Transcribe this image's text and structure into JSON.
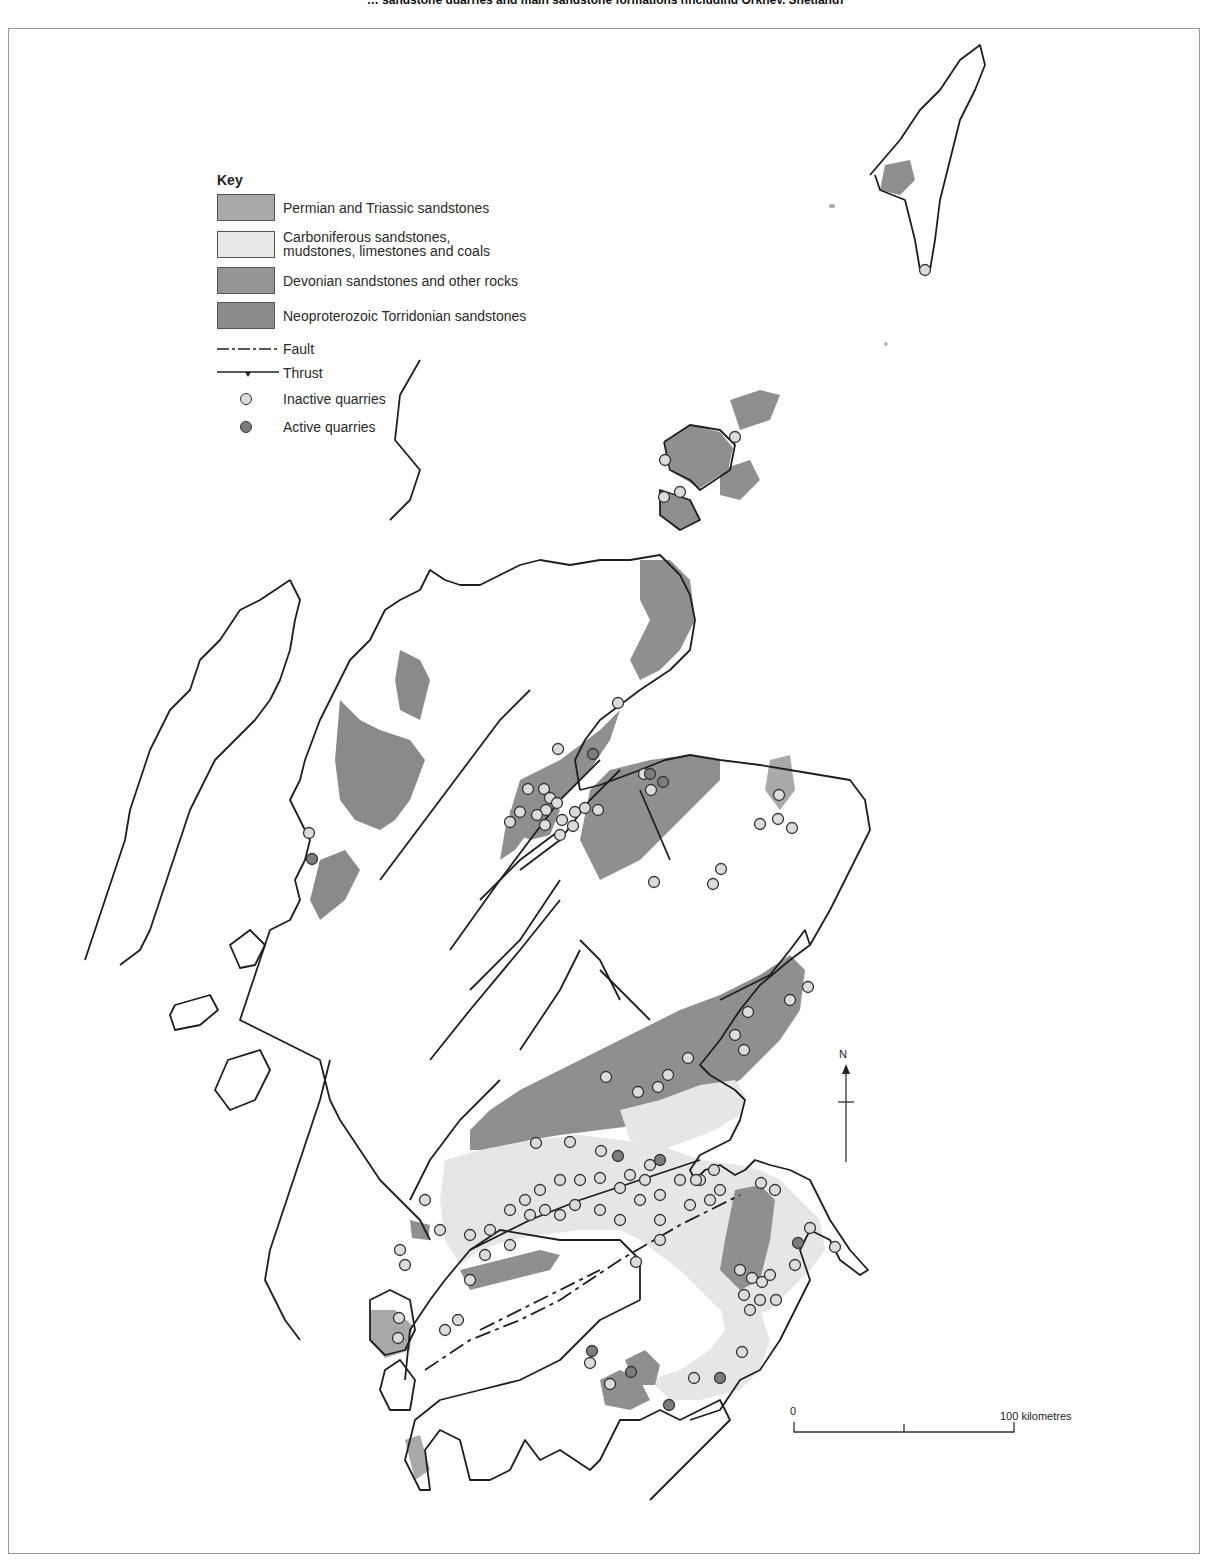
{
  "figure": {
    "caption_partial": "… sandstone quarries and main sandstone formations (including Orkney, Shetland)"
  },
  "colors": {
    "permian_triassic": "#a9a9a9",
    "carboniferous": "#e6e6e6",
    "devonian": "#8f8f8f",
    "torridonian": "#8a8a8a",
    "coastline": "#1e1e1e",
    "inactive_quarry": "#dcdcdc",
    "active_quarry": "#7c7c7c",
    "frame": "#9a9a9a"
  },
  "legend": {
    "title": "Key",
    "units": [
      {
        "label": "Permian and Triassic sandstones",
        "color": "#a9a9a9"
      },
      {
        "label": "Carboniferous sandstones,\nmudstones, limestones and coals",
        "color": "#e8e8e8"
      },
      {
        "label": "Devonian sandstones and other rocks",
        "color": "#959595"
      },
      {
        "label": "Neoproterozoic Torridonian sandstones",
        "color": "#8a8a8a"
      }
    ],
    "lines": [
      {
        "label": "Fault",
        "style": "dash-dot"
      },
      {
        "label": "Thrust",
        "style": "barbed"
      }
    ],
    "points": [
      {
        "label": "Inactive quarries",
        "color": "#dcdcdc"
      },
      {
        "label": "Active quarries",
        "color": "#7c7c7c"
      }
    ]
  },
  "north_arrow": {
    "label": "N"
  },
  "scale_bar": {
    "start_label": "0",
    "end_label": "100 kilometres"
  },
  "map": {
    "coastlines": [
      "M640,1300 L600,1320 L560,1360 L520,1380 L480,1390 L440,1400 L415,1420 L405,1460 L420,1490 L430,1490 L425,1450 L440,1430 L460,1440 L470,1480 L490,1480 L510,1470 L525,1440 L540,1460 L560,1450 L590,1470 L600,1460 L620,1420 L640,1420 L660,1410 L680,1420 L700,1410 L720,1400 L730,1420 L700,1450 L660,1490 L650,1500",
      "M640,1300 L640,1260 L620,1240 L560,1240 L500,1230 L470,1250 L445,1280 L430,1300 L410,1330 L405,1380",
      "M690,1420 L720,1410 L740,1380 L760,1370 L780,1340 L790,1320 L800,1300 L810,1280 L800,1250 L810,1230 L830,1240 L840,1260 L860,1275 L868,1270 L850,1250 L830,1220 L820,1200 L810,1180 L790,1170 L770,1165 L755,1160 L745,1170 L735,1175 L720,1165 L705,1170 L695,1180",
      "M695,1180 L690,1170 L700,1155 L730,1140 L740,1120 L745,1100 L735,1090 L710,1075 L700,1065 L720,1040 L740,1010 L760,985 L790,960 L810,945 L805,930 L790,950 L770,975 L740,990 L720,1000",
      "M810,945 L830,910 L845,880 L860,850 L870,830 L865,800 L850,780 L820,775 L790,770 L760,765 L720,760 L690,755 L665,760 L640,770 L600,785 L580,790",
      "M580,790 L575,760 L585,740 L600,720 L640,690 L670,670 L690,650 L695,620 L690,595 L680,575 L660,555 L630,560 L600,560 L570,565 L540,560 L520,565 L500,575 L480,585 L460,585 L445,580",
      "M445,580 L430,570 L420,590 L400,600 L385,610 L370,640 L350,660 L340,680 L330,700 L320,720 L305,760 L300,780 L290,800 L300,820 L310,840 L305,860 L295,880 L300,900 L290,920 L270,930 L260,960 L250,990 L240,1020 L260,1030 L280,1040 L300,1050 L320,1060 L330,1100 L340,1120 L360,1150 L380,1180 L400,1200 L420,1220 L430,1240",
      "M330,1060 L320,1100 L310,1130 L300,1160 L290,1190 L280,1220 L270,1250 L265,1280 L275,1300 L285,1320 L300,1340",
      "M290,580 L260,600 L240,610 L220,640 L200,660 L190,690 L170,710 L160,730 L150,750 L140,780 L130,810 L125,840 L115,870 L105,900 L95,930 L85,960",
      "M290,580 L300,600 L295,620 L290,650 L280,680 L270,700 L255,720 L235,740 L215,760 L200,790 L190,810 L180,840 L170,870 L160,900 L150,930 L140,950 L120,965",
      "M420,360 L400,395 L395,440 L420,470 L410,500 L390,520",
      "M870,175 L900,140 L920,110 L940,90 L960,60 L980,45 L985,65 L975,90 L960,120 L950,160 L940,200 L935,240 L930,270 L920,270 L915,240 L905,200 L880,190 L875,175",
      "M664,442 L690,425 L720,430 L735,445 L730,470 L700,490 L690,480 L670,470 L664,442",
      "M660,490 L690,500 L700,520 L680,530 L660,515 Z",
      "M370,1300 L390,1290 L410,1300 L415,1330 L405,1350 L385,1355 L370,1340 Z",
      "M385,1370 L400,1360 L415,1380 L410,1410 L390,1410 L380,1390 Z",
      "M228,1060 L260,1050 L270,1070 L255,1100 L230,1110 L215,1090 Z",
      "M230,945 L250,930 L265,945 L255,965 L240,968 Z",
      "M175,1005 L210,995 L218,1010 L200,1025 L175,1030 L170,1015 Z"
    ],
    "units": [
      {
        "unit": "devonian",
        "path": "M590,790 L610,770 L650,760 L690,755 L720,760 L720,780 L700,800 L680,820 L660,840 L640,860 L620,870 L600,880 L590,860 L580,840 Z"
      },
      {
        "unit": "devonian",
        "path": "M640,560 L670,560 L690,580 L695,620 L680,650 L660,670 L640,680 L630,660 L640,640 L650,620 L640,600 Z"
      },
      {
        "unit": "devonian",
        "path": "M520,780 L560,760 L600,730 L620,710 L610,740 L590,770 L570,790 L550,810 L530,830 L515,850 L500,860 L505,830 Z"
      },
      {
        "unit": "devonian",
        "path": "M510,810 L540,800 L560,810 L550,835 L530,840 L510,830 Z"
      },
      {
        "unit": "torridonian",
        "path": "M340,700 L360,720 L380,730 L410,740 L425,760 L410,800 L395,820 L380,830 L355,820 L340,800 L335,760 Z"
      },
      {
        "unit": "torridonian",
        "path": "M400,650 L420,660 L430,680 L420,720 L400,710 L395,680 Z"
      },
      {
        "unit": "torridonian",
        "path": "M320,860 L345,850 L360,870 L345,900 L320,920 L310,900 Z"
      },
      {
        "unit": "devonian",
        "path": "M665,1115 L700,1100 L740,1080 L760,1060 L780,1040 L800,1010 L805,970 L790,955 L760,975 L720,995 L680,1010 L640,1030 L600,1050 L560,1070 L520,1090 L490,1110 L470,1130 L470,1150 L500,1150 L530,1140 L560,1135 L600,1130 L640,1125 Z"
      },
      {
        "unit": "carboniferous",
        "path": "M445,1160 L480,1150 L530,1140 L580,1135 L620,1140 L660,1145 L700,1160 L740,1165 L760,1170 L780,1180 L800,1200 L820,1220 L825,1250 L810,1270 L790,1290 L770,1310 L740,1320 L720,1310 L700,1290 L680,1270 L660,1255 L640,1240 L620,1230 L580,1230 L540,1235 L510,1240 L480,1250 L460,1265 L445,1240 L440,1200 Z"
      },
      {
        "unit": "carboniferous",
        "path": "M620,1110 L660,1100 L700,1085 L735,1080 L745,1095 L740,1115 L715,1130 L690,1140 L660,1150 L630,1140 Z"
      },
      {
        "unit": "devonian",
        "path": "M735,1190 L760,1185 L775,1200 L770,1240 L760,1280 L740,1290 L720,1270 L725,1240 Z"
      },
      {
        "unit": "devonian",
        "path": "M460,1270 L500,1260 L540,1250 L560,1255 L550,1270 L510,1280 L470,1290 Z"
      },
      {
        "unit": "carboniferous",
        "path": "M720,1300 L760,1310 L770,1340 L760,1370 L740,1390 L700,1400 L670,1400 L650,1380 L680,1370 L710,1350 L725,1330 Z"
      },
      {
        "unit": "devonian",
        "path": "M600,1380 L620,1370 L640,1380 L650,1400 L630,1410 L605,1405 Z"
      },
      {
        "unit": "devonian",
        "path": "M625,1360 L645,1350 L660,1365 L655,1385 L635,1385 Z"
      },
      {
        "unit": "permian_triassic",
        "path": "M370,1310 L395,1310 L412,1325 L410,1350 L385,1358 L370,1340 Z"
      },
      {
        "unit": "permian_triassic",
        "path": "M405,1440 L420,1435 L430,1470 L415,1480 Z"
      },
      {
        "unit": "devonian",
        "path": "M885,165 L910,160 L915,180 L900,195 L880,190 Z"
      },
      {
        "unit": "devonian",
        "path": "M664,442 L690,425 L720,432 L733,448 L728,470 L700,488 L672,472 Z"
      },
      {
        "unit": "devonian",
        "path": "M660,492 L690,500 L700,520 L678,530 L660,515 Z"
      },
      {
        "unit": "devonian",
        "path": "M720,470 L750,460 L760,480 L740,500 L720,495 Z"
      },
      {
        "unit": "devonian",
        "path": "M730,400 L760,390 L780,395 L770,420 L740,430 Z"
      },
      {
        "unit": "permian_triassic",
        "path": "M770,760 L790,755 L795,790 L780,810 L765,790 Z"
      },
      {
        "unit": "devonian",
        "path": "M410,1220 L430,1225 L428,1240 L412,1238 Z"
      }
    ],
    "faults": [
      "M450,950 L500,880 L560,800 L600,760",
      "M380,880 L440,800 L500,720 L530,690",
      "M480,900 L520,860 L560,830",
      "M520,870 L560,840 L590,800 L620,770",
      "M430,1060 L470,1010 L520,950 L560,900",
      "M470,990 L520,940 L560,880",
      "M520,1050 L560,990 L580,950",
      "M600,970 L640,1010 L650,1020",
      "M620,1000 L600,960 L580,940",
      "M410,1200 L430,1160 L460,1120 L500,1080",
      "M470,1250 L530,1220 L580,1200 L640,1180 L700,1160",
      "M640,790 L670,860"
    ],
    "dash_faults": [
      "M425,1370 L470,1340 L520,1320 L560,1300 L620,1260 L680,1225 L740,1195",
      "M480,1330 L540,1300 L600,1270"
    ],
    "quarries": [
      {
        "x": 925,
        "y": 270,
        "active": false
      },
      {
        "x": 735,
        "y": 437,
        "active": false
      },
      {
        "x": 665,
        "y": 460,
        "active": false
      },
      {
        "x": 680,
        "y": 492,
        "active": false
      },
      {
        "x": 664,
        "y": 497,
        "active": false
      },
      {
        "x": 618,
        "y": 703,
        "active": false
      },
      {
        "x": 558,
        "y": 749,
        "active": false
      },
      {
        "x": 593,
        "y": 754,
        "active": true
      },
      {
        "x": 528,
        "y": 789,
        "active": false
      },
      {
        "x": 544,
        "y": 789,
        "active": false
      },
      {
        "x": 550,
        "y": 798,
        "active": false
      },
      {
        "x": 557,
        "y": 803,
        "active": false
      },
      {
        "x": 546,
        "y": 810,
        "active": false
      },
      {
        "x": 520,
        "y": 812,
        "active": false
      },
      {
        "x": 537,
        "y": 815,
        "active": false
      },
      {
        "x": 575,
        "y": 812,
        "active": false
      },
      {
        "x": 585,
        "y": 808,
        "active": false
      },
      {
        "x": 598,
        "y": 810,
        "active": false
      },
      {
        "x": 562,
        "y": 820,
        "active": false
      },
      {
        "x": 573,
        "y": 826,
        "active": false
      },
      {
        "x": 545,
        "y": 825,
        "active": false
      },
      {
        "x": 510,
        "y": 822,
        "active": false
      },
      {
        "x": 560,
        "y": 835,
        "active": false
      },
      {
        "x": 644,
        "y": 774,
        "active": false
      },
      {
        "x": 650,
        "y": 774,
        "active": true
      },
      {
        "x": 663,
        "y": 782,
        "active": true
      },
      {
        "x": 651,
        "y": 790,
        "active": false
      },
      {
        "x": 779,
        "y": 795,
        "active": false
      },
      {
        "x": 778,
        "y": 819,
        "active": false
      },
      {
        "x": 760,
        "y": 824,
        "active": false
      },
      {
        "x": 792,
        "y": 828,
        "active": false
      },
      {
        "x": 721,
        "y": 869,
        "active": false
      },
      {
        "x": 713,
        "y": 884,
        "active": false
      },
      {
        "x": 654,
        "y": 882,
        "active": false
      },
      {
        "x": 309,
        "y": 833,
        "active": false
      },
      {
        "x": 312,
        "y": 859,
        "active": true
      },
      {
        "x": 735,
        "y": 1035,
        "active": false
      },
      {
        "x": 808,
        "y": 987,
        "active": false
      },
      {
        "x": 790,
        "y": 1000,
        "active": false
      },
      {
        "x": 748,
        "y": 1012,
        "active": false
      },
      {
        "x": 744,
        "y": 1050,
        "active": false
      },
      {
        "x": 688,
        "y": 1058,
        "active": false
      },
      {
        "x": 668,
        "y": 1075,
        "active": false
      },
      {
        "x": 658,
        "y": 1087,
        "active": false
      },
      {
        "x": 638,
        "y": 1092,
        "active": false
      },
      {
        "x": 606,
        "y": 1077,
        "active": false
      },
      {
        "x": 570,
        "y": 1142,
        "active": false
      },
      {
        "x": 536,
        "y": 1143,
        "active": false
      },
      {
        "x": 601,
        "y": 1151,
        "active": false
      },
      {
        "x": 618,
        "y": 1156,
        "active": true
      },
      {
        "x": 650,
        "y": 1165,
        "active": false
      },
      {
        "x": 660,
        "y": 1160,
        "active": true
      },
      {
        "x": 630,
        "y": 1175,
        "active": false
      },
      {
        "x": 645,
        "y": 1180,
        "active": false
      },
      {
        "x": 680,
        "y": 1180,
        "active": false
      },
      {
        "x": 700,
        "y": 1180,
        "active": false
      },
      {
        "x": 720,
        "y": 1190,
        "active": false
      },
      {
        "x": 710,
        "y": 1200,
        "active": false
      },
      {
        "x": 690,
        "y": 1205,
        "active": false
      },
      {
        "x": 660,
        "y": 1195,
        "active": false
      },
      {
        "x": 640,
        "y": 1200,
        "active": false
      },
      {
        "x": 620,
        "y": 1188,
        "active": false
      },
      {
        "x": 600,
        "y": 1178,
        "active": false
      },
      {
        "x": 580,
        "y": 1180,
        "active": false
      },
      {
        "x": 560,
        "y": 1180,
        "active": false
      },
      {
        "x": 540,
        "y": 1190,
        "active": false
      },
      {
        "x": 525,
        "y": 1200,
        "active": false
      },
      {
        "x": 510,
        "y": 1210,
        "active": false
      },
      {
        "x": 530,
        "y": 1215,
        "active": false
      },
      {
        "x": 545,
        "y": 1210,
        "active": false
      },
      {
        "x": 560,
        "y": 1215,
        "active": false
      },
      {
        "x": 575,
        "y": 1205,
        "active": false
      },
      {
        "x": 600,
        "y": 1210,
        "active": false
      },
      {
        "x": 620,
        "y": 1220,
        "active": false
      },
      {
        "x": 660,
        "y": 1220,
        "active": false
      },
      {
        "x": 490,
        "y": 1230,
        "active": false
      },
      {
        "x": 470,
        "y": 1235,
        "active": false
      },
      {
        "x": 440,
        "y": 1230,
        "active": false
      },
      {
        "x": 425,
        "y": 1200,
        "active": false
      },
      {
        "x": 510,
        "y": 1245,
        "active": false
      },
      {
        "x": 485,
        "y": 1255,
        "active": false
      },
      {
        "x": 660,
        "y": 1240,
        "active": false
      },
      {
        "x": 636,
        "y": 1262,
        "active": false
      },
      {
        "x": 400,
        "y": 1250,
        "active": false
      },
      {
        "x": 405,
        "y": 1265,
        "active": false
      },
      {
        "x": 399,
        "y": 1318,
        "active": false
      },
      {
        "x": 398,
        "y": 1338,
        "active": false
      },
      {
        "x": 470,
        "y": 1280,
        "active": false
      },
      {
        "x": 458,
        "y": 1320,
        "active": false
      },
      {
        "x": 445,
        "y": 1330,
        "active": false
      },
      {
        "x": 696,
        "y": 1180,
        "active": false
      },
      {
        "x": 714,
        "y": 1170,
        "active": false
      },
      {
        "x": 761,
        "y": 1183,
        "active": false
      },
      {
        "x": 775,
        "y": 1190,
        "active": false
      },
      {
        "x": 810,
        "y": 1228,
        "active": false
      },
      {
        "x": 798,
        "y": 1243,
        "active": true
      },
      {
        "x": 795,
        "y": 1265,
        "active": false
      },
      {
        "x": 835,
        "y": 1247,
        "active": false
      },
      {
        "x": 740,
        "y": 1270,
        "active": false
      },
      {
        "x": 752,
        "y": 1278,
        "active": false
      },
      {
        "x": 762,
        "y": 1282,
        "active": false
      },
      {
        "x": 770,
        "y": 1275,
        "active": false
      },
      {
        "x": 744,
        "y": 1295,
        "active": false
      },
      {
        "x": 760,
        "y": 1300,
        "active": false
      },
      {
        "x": 776,
        "y": 1300,
        "active": false
      },
      {
        "x": 750,
        "y": 1310,
        "active": false
      },
      {
        "x": 592,
        "y": 1351,
        "active": true
      },
      {
        "x": 590,
        "y": 1363,
        "active": false
      },
      {
        "x": 631,
        "y": 1372,
        "active": true
      },
      {
        "x": 610,
        "y": 1384,
        "active": false
      },
      {
        "x": 694,
        "y": 1378,
        "active": false
      },
      {
        "x": 720,
        "y": 1378,
        "active": true
      },
      {
        "x": 669,
        "y": 1405,
        "active": true
      },
      {
        "x": 742,
        "y": 1352,
        "active": false
      }
    ],
    "small_islets": [
      {
        "x": 832,
        "y": 206,
        "w": 6,
        "h": 4
      },
      {
        "x": 886,
        "y": 344,
        "w": 3,
        "h": 4
      }
    ]
  }
}
